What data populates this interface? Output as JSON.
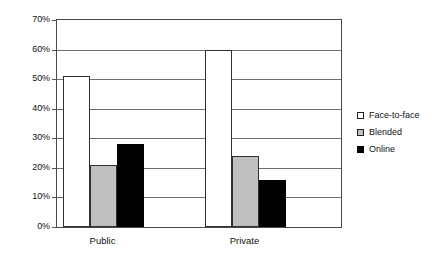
{
  "chart_data": {
    "type": "bar",
    "title": "",
    "subtitle": "",
    "xlabel": "",
    "ylabel": "",
    "categories": [
      "Public",
      "Private"
    ],
    "series": [
      {
        "name": "Face-to-face",
        "values": [
          51,
          60
        ],
        "color": "#ffffff"
      },
      {
        "name": "Blended",
        "values": [
          21,
          24
        ],
        "color": "#bfbfbf"
      },
      {
        "name": "Online",
        "values": [
          28,
          16
        ],
        "color": "#000000"
      }
    ],
    "ylim": [
      0,
      70
    ],
    "ytick_values": [
      0,
      10,
      20,
      30,
      40,
      50,
      60,
      70
    ],
    "ytick_labels": [
      "0%",
      "10%",
      "20%",
      "30%",
      "40%",
      "50%",
      "60%",
      "70%"
    ],
    "grid": true,
    "grid_axis": "y",
    "legend_position": "right",
    "value_suffix": "%",
    "annotations": []
  },
  "legend": {
    "items": [
      {
        "label": "Face-to-face",
        "swatch": "white-square-icon"
      },
      {
        "label": "Blended",
        "swatch": "gray-square-icon"
      },
      {
        "label": "Online",
        "swatch": "black-square-icon"
      }
    ]
  },
  "axes": {
    "y_ticks": [
      "70%",
      "60%",
      "50%",
      "40%",
      "30%",
      "20%",
      "10%",
      "0%"
    ],
    "x_ticks": [
      "Public",
      "Private"
    ]
  }
}
